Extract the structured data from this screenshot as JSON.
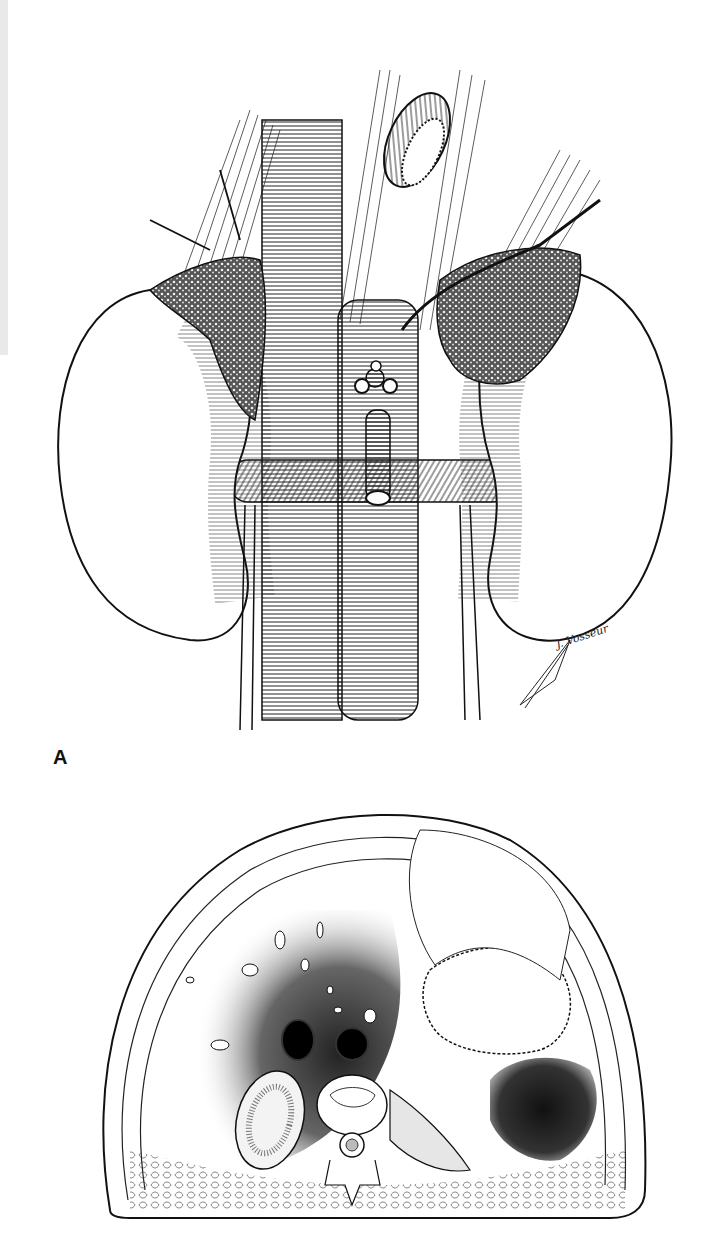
{
  "page": {
    "type": "anatomy textbook page",
    "background": "#ffffff",
    "ink_color": "#1a1a1a"
  },
  "figure_a": {
    "panel_label": "A",
    "subject": "kidneys-adrenals-great-vessels illustration",
    "signature": "J. Vosseur",
    "signature_icon": "quill-pen-icon"
  },
  "figure_b": {
    "subject": "transverse abdominal cross-section illustration"
  }
}
